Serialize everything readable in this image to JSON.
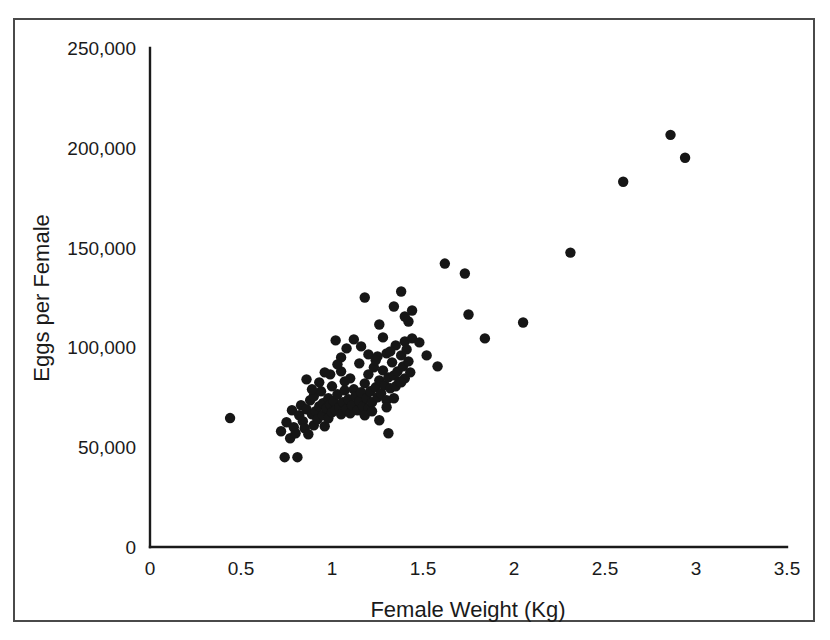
{
  "chart_data": {
    "type": "scatter",
    "title": "",
    "xlabel": "Female Weight (Kg)",
    "ylabel": "Eggs per Female",
    "xlim": [
      0,
      3.5
    ],
    "ylim": [
      0,
      250000
    ],
    "xticks": [
      0,
      0.5,
      1,
      1.5,
      2,
      2.5,
      3,
      3.5
    ],
    "xticklabels": [
      "0",
      "0.5",
      "1",
      "1.5",
      "2",
      "2.5",
      "3",
      "3.5"
    ],
    "yticks": [
      0,
      50000,
      100000,
      150000,
      200000,
      250000
    ],
    "yticklabels": [
      "0",
      "50,000",
      "100,000",
      "150,000",
      "200,000",
      "250,000"
    ],
    "grid": false,
    "legend": null,
    "marker": {
      "shape": "circle",
      "color": "#161616",
      "size_px": 5.2
    },
    "series": [
      {
        "name": "Eggs per Female vs Female Weight",
        "points": [
          [
            0.44,
            64600
          ],
          [
            0.74,
            45000
          ],
          [
            0.81,
            45000
          ],
          [
            0.72,
            58000
          ],
          [
            0.75,
            62500
          ],
          [
            0.77,
            54500
          ],
          [
            0.78,
            68500
          ],
          [
            0.79,
            60000
          ],
          [
            0.8,
            57000
          ],
          [
            0.82,
            66000
          ],
          [
            0.83,
            71000
          ],
          [
            0.84,
            63000
          ],
          [
            0.85,
            59500
          ],
          [
            0.86,
            69000
          ],
          [
            0.87,
            56500
          ],
          [
            0.88,
            73500
          ],
          [
            0.89,
            66500
          ],
          [
            0.9,
            61000
          ],
          [
            0.9,
            75500
          ],
          [
            0.91,
            68000
          ],
          [
            0.92,
            64000
          ],
          [
            0.93,
            70500
          ],
          [
            0.94,
            78000
          ],
          [
            0.95,
            66000
          ],
          [
            0.95,
            72000
          ],
          [
            0.96,
            60500
          ],
          [
            0.97,
            69500
          ],
          [
            0.98,
            74500
          ],
          [
            0.98,
            64500
          ],
          [
            0.99,
            71500
          ],
          [
            1.0,
            67500
          ],
          [
            1.0,
            80500
          ],
          [
            1.01,
            73000
          ],
          [
            1.02,
            68500
          ],
          [
            1.03,
            76500
          ],
          [
            1.04,
            70000
          ],
          [
            1.05,
            66500
          ],
          [
            1.05,
            88000
          ],
          [
            1.06,
            72500
          ],
          [
            1.07,
            78500
          ],
          [
            1.08,
            69000
          ],
          [
            1.09,
            74000
          ],
          [
            1.1,
            67000
          ],
          [
            1.1,
            84500
          ],
          [
            1.11,
            71000
          ],
          [
            1.12,
            79000
          ],
          [
            1.13,
            75500
          ],
          [
            1.14,
            68500
          ],
          [
            1.15,
            73000
          ],
          [
            1.15,
            92000
          ],
          [
            1.16,
            77500
          ],
          [
            1.17,
            70500
          ],
          [
            1.18,
            82000
          ],
          [
            1.19,
            74500
          ],
          [
            1.2,
            69500
          ],
          [
            1.2,
            86500
          ],
          [
            1.21,
            78000
          ],
          [
            1.22,
            72500
          ],
          [
            1.23,
            90000
          ],
          [
            1.24,
            80000
          ],
          [
            1.25,
            75000
          ],
          [
            1.25,
            95500
          ],
          [
            1.26,
            83500
          ],
          [
            1.27,
            77000
          ],
          [
            1.28,
            88500
          ],
          [
            1.29,
            81000
          ],
          [
            1.3,
            73500
          ],
          [
            1.3,
            97000
          ],
          [
            1.31,
            85000
          ],
          [
            1.32,
            79500
          ],
          [
            1.33,
            92500
          ],
          [
            1.34,
            86000
          ],
          [
            1.35,
            80500
          ],
          [
            1.35,
            101000
          ],
          [
            1.36,
            88000
          ],
          [
            1.37,
            83000
          ],
          [
            1.38,
            96000
          ],
          [
            1.39,
            90500
          ],
          [
            1.4,
            84500
          ],
          [
            1.4,
            103000
          ],
          [
            1.41,
            99000
          ],
          [
            1.42,
            93000
          ],
          [
            1.43,
            87500
          ],
          [
            1.44,
            104500
          ],
          [
            1.02,
            103500
          ],
          [
            1.05,
            95000
          ],
          [
            1.08,
            99500
          ],
          [
            1.12,
            104000
          ],
          [
            1.16,
            100500
          ],
          [
            1.2,
            96500
          ],
          [
            1.24,
            93500
          ],
          [
            1.28,
            105000
          ],
          [
            1.32,
            98000
          ],
          [
            0.99,
            86500
          ],
          [
            1.03,
            91500
          ],
          [
            1.07,
            83000
          ],
          [
            0.93,
            82500
          ],
          [
            0.96,
            87500
          ],
          [
            0.89,
            79000
          ],
          [
            0.86,
            84000
          ],
          [
            1.18,
            66000
          ],
          [
            1.22,
            68000
          ],
          [
            1.26,
            63500
          ],
          [
            1.3,
            70000
          ],
          [
            1.34,
            74500
          ],
          [
            1.38,
            82500
          ],
          [
            1.42,
            113000
          ],
          [
            1.44,
            118500
          ],
          [
            1.34,
            120500
          ],
          [
            1.38,
            128000
          ],
          [
            1.18,
            125000
          ],
          [
            1.26,
            111500
          ],
          [
            1.4,
            115500
          ],
          [
            1.31,
            57000
          ],
          [
            1.48,
            102500
          ],
          [
            1.62,
            142000
          ],
          [
            1.73,
            137000
          ],
          [
            1.75,
            116500
          ],
          [
            1.84,
            104500
          ],
          [
            2.05,
            112500
          ],
          [
            2.31,
            147500
          ],
          [
            2.6,
            183000
          ],
          [
            2.86,
            206500
          ],
          [
            2.94,
            195000
          ],
          [
            1.58,
            90500
          ],
          [
            1.52,
            96000
          ]
        ]
      }
    ]
  },
  "axes": {
    "x_title": "Female Weight (Kg)",
    "y_title": "Eggs per Female"
  }
}
